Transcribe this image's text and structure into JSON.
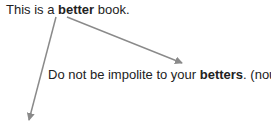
{
  "sentence1": {
    "before": "This is a ",
    "highlight": "better",
    "after": " book."
  },
  "sentence2": {
    "before": "Do not be impolite to your ",
    "highlight": "betters",
    "after": ". (noun)"
  },
  "colors": {
    "text": "#222222",
    "arrow": "#8a8a8a"
  }
}
